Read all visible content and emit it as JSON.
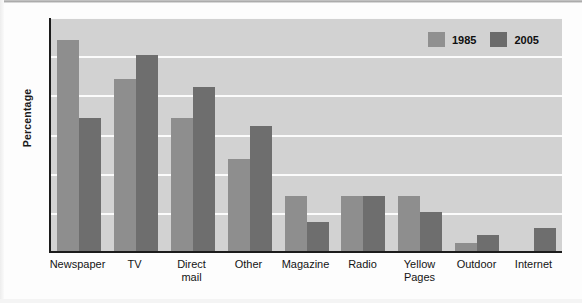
{
  "chart_data": {
    "type": "bar",
    "title": "",
    "xlabel": "",
    "ylabel": "Percentage",
    "ylim": [
      0,
      30
    ],
    "yticks": [
      0,
      5,
      10,
      15,
      20,
      25,
      30
    ],
    "grid": true,
    "legend_position": "top-right",
    "categories": [
      "Newspaper",
      "TV",
      "Direct\nmail",
      "Other",
      "Magazine",
      "Radio",
      "Yellow\nPages",
      "Outdoor",
      "Internet"
    ],
    "series": [
      {
        "name": "1985",
        "color": "#8e8e8e",
        "values": [
          27,
          22,
          17,
          11.8,
          7,
          7,
          7,
          1,
          0
        ]
      },
      {
        "name": "2005",
        "color": "#6e6e6e",
        "values": [
          17,
          25,
          21,
          16,
          3.7,
          7,
          5,
          2,
          3
        ]
      }
    ]
  },
  "legend": {
    "items": [
      {
        "label": "1985",
        "swatch": "legend-swatch-1985"
      },
      {
        "label": "2005",
        "swatch": "legend-swatch-2005"
      }
    ]
  },
  "axis": {
    "y_title": "Percentage"
  }
}
